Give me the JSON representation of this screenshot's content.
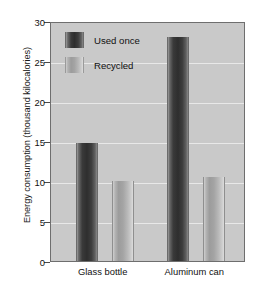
{
  "chart_data": {
    "type": "bar",
    "title": "",
    "xlabel": "",
    "ylabel": "Energy consumption (thousand kilocalories)",
    "categories": [
      "Glass bottle",
      "Aluminum can"
    ],
    "series": [
      {
        "name": "Used once",
        "values": [
          14.8,
          28.0
        ],
        "color": "#2e2e2e"
      },
      {
        "name": "Recycled",
        "values": [
          10.0,
          10.5
        ],
        "color": "#a4a4a4"
      }
    ],
    "ylim": [
      0,
      30
    ],
    "yticks": [
      0,
      5,
      10,
      15,
      20,
      25,
      30
    ],
    "ytick_labels": [
      "0",
      "5",
      "10",
      "15",
      "20",
      "25",
      "30"
    ],
    "grid": true,
    "gridlines_at": [
      5,
      10,
      15,
      20,
      25
    ],
    "legend_position": "top-left",
    "plot_background": "#c9c9c9",
    "figure_background": "#ffffff",
    "axis_color": "#6e6e6e"
  },
  "legend": {
    "entries": [
      {
        "label": "Used once",
        "swatch": "used"
      },
      {
        "label": "Recycled",
        "swatch": "recycled"
      }
    ]
  },
  "axes": {
    "y_title": "Energy consumption (thousand kilocalories)",
    "y_tick_labels": [
      "30",
      "25",
      "20",
      "15",
      "10",
      "5",
      "0"
    ],
    "x_tick_labels": [
      "Glass bottle",
      "Aluminum can"
    ]
  }
}
